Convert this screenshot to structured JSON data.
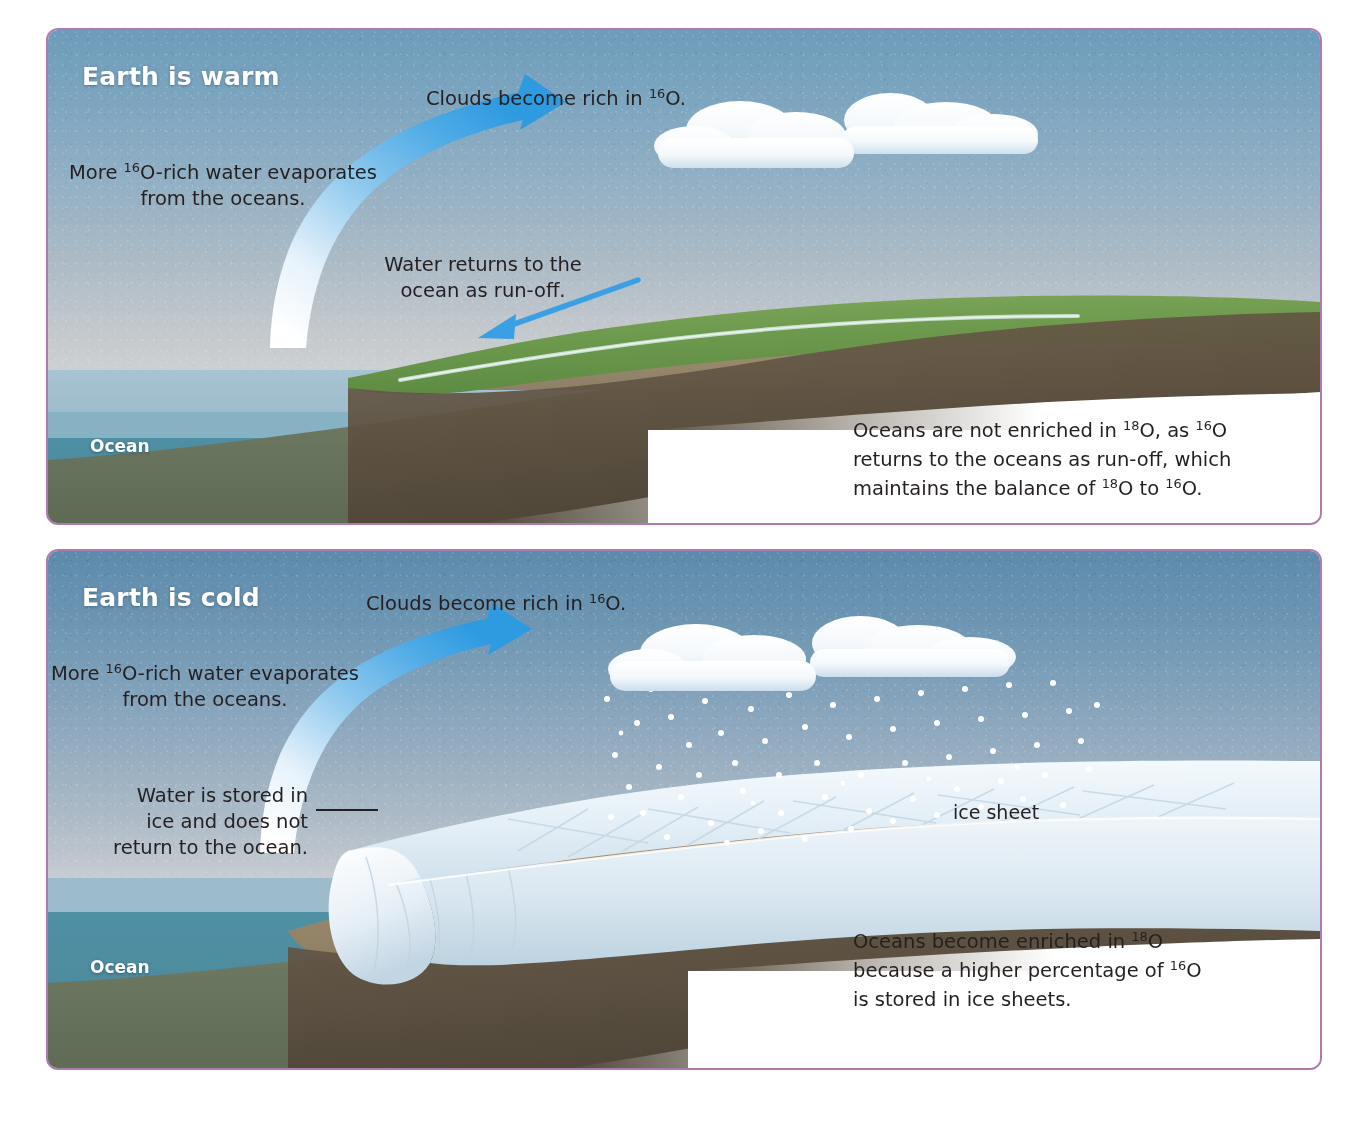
{
  "figure": {
    "type": "two-panel scientific illustration",
    "topic": "Oxygen isotope ratios in oceans during warm and cold climate states"
  },
  "panels": [
    {
      "id": "warm",
      "title": "Earth is warm",
      "ocean_label": "Ocean",
      "annotations": {
        "clouds": {
          "pre": "Clouds become rich in ",
          "sup": "16",
          "post": "O."
        },
        "evaporation_line1_pre": "More ",
        "evaporation_line1_sup": "16",
        "evaporation_line1_post": "O-rich water evaporates",
        "evaporation_line2": "from the oceans.",
        "runoff_line1": "Water returns to the",
        "runoff_line2": "ocean as run-off."
      },
      "caption": {
        "l1_a": "Oceans are not enriched in ",
        "l1_sup1": "18",
        "l1_b": "O, as ",
        "l1_sup2": "16",
        "l1_c": "O",
        "l2": "returns to the oceans as run-off, which",
        "l3_a": "maintains the balance of ",
        "l3_sup1": "18",
        "l3_b": "O to ",
        "l3_sup2": "16",
        "l3_c": "O."
      }
    },
    {
      "id": "cold",
      "title": "Earth is cold",
      "ocean_label": "Ocean",
      "ice_sheet_label": "ice sheet",
      "annotations": {
        "clouds": {
          "pre": "Clouds become rich in ",
          "sup": "16",
          "post": "O."
        },
        "evaporation_line1_pre": "More ",
        "evaporation_line1_sup": "16",
        "evaporation_line1_post": "O-rich water evaporates",
        "evaporation_line2": "from the oceans.",
        "storage_line1": "Water is stored in",
        "storage_line2": "ice and does not",
        "storage_line3": "return to the ocean."
      },
      "caption": {
        "l1_a": "Oceans become enriched in ",
        "l1_sup": "18",
        "l1_b": "O",
        "l2_a": "because a higher percentage of ",
        "l2_sup": "16",
        "l2_b": "O",
        "l3": "is stored in ice sheets."
      }
    }
  ],
  "colors": {
    "panel_border": "#b07ab0",
    "sky_top_warm": "#6d9cba",
    "sky_top_cold": "#5e8aab",
    "ocean_deep": "#4e8fa3",
    "ocean_surface": "#a8c3d2",
    "land_green": "#6f9a4e",
    "land_brown": "#8a7a5e",
    "seabed": "#6f7c66",
    "arrow_blue": "#3ba0e3",
    "ice_white": "#e8f1f7",
    "text": "#241f20",
    "title_text": "#ffffff"
  }
}
